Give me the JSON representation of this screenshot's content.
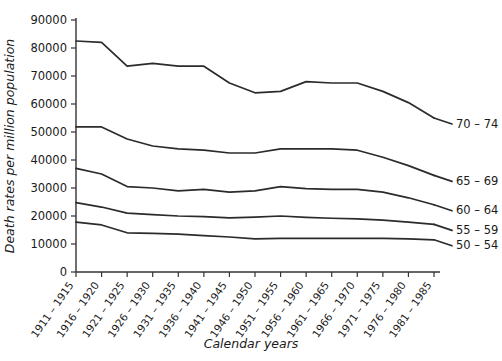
{
  "chart_data": {
    "type": "line",
    "title": "",
    "xlabel": "Calendar years",
    "ylabel": "Death rates per million population",
    "grid": false,
    "legend_position": "right-end-of-line",
    "ylim": [
      0,
      90000
    ],
    "yticks": [
      0,
      10000,
      20000,
      30000,
      40000,
      50000,
      60000,
      70000,
      80000,
      90000
    ],
    "ytick_labels": [
      "0",
      "10000",
      "20000",
      "30000",
      "40000",
      "50000",
      "60000",
      "70000",
      "80000",
      "90000"
    ],
    "categories": [
      "1911 – 1915",
      "1916 – 1920",
      "1921 – 1925",
      "1926 – 1930",
      "1931 – 1935",
      "1936 – 1940",
      "1941 – 1945",
      "1946 – 1950",
      "1951 – 1955",
      "1956 – 1960",
      "1961 – 1965",
      "1966 – 1970",
      "1971 – 1975",
      "1976 – 1980",
      "1981 – 1985"
    ],
    "series": [
      {
        "name": "70 – 74",
        "values": [
          82500,
          82000,
          73500,
          74500,
          73500,
          73500,
          67500,
          64000,
          64500,
          68000,
          67500,
          67500,
          64500,
          60500,
          55000
        ]
      },
      {
        "name": "65 – 69",
        "values": [
          51800,
          51800,
          47500,
          45000,
          44000,
          43500,
          42500,
          42500,
          44000,
          44000,
          44000,
          43500,
          41000,
          38000,
          34500
        ]
      },
      {
        "name": "60 – 64",
        "values": [
          37000,
          35000,
          30500,
          30000,
          29000,
          29500,
          28500,
          29000,
          30500,
          29800,
          29500,
          29500,
          28500,
          26500,
          24000
        ]
      },
      {
        "name": "55 – 59",
        "values": [
          24800,
          23200,
          21000,
          20500,
          20000,
          19800,
          19300,
          19600,
          20000,
          19500,
          19200,
          19000,
          18500,
          17800,
          17000
        ]
      },
      {
        "name": "50 – 54",
        "values": [
          17800,
          16800,
          14000,
          13800,
          13500,
          13000,
          12500,
          11800,
          12000,
          12000,
          12000,
          12000,
          12000,
          11800,
          11500
        ]
      }
    ]
  },
  "axes": {
    "y_title": "Death rates per million population",
    "x_title": "Calendar years"
  }
}
